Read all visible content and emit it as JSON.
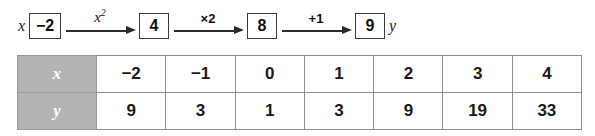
{
  "diagram": {
    "input_label": "x",
    "output_label": "y",
    "steps": [
      {
        "value": "−2",
        "op": "x²",
        "op_style": "serif-italic"
      },
      {
        "value": "4",
        "op": "×2",
        "op_style": "sans-bold"
      },
      {
        "value": "8",
        "op": "+1",
        "op_style": "sans-bold"
      },
      {
        "value": "9",
        "op": "",
        "op_style": ""
      }
    ],
    "op_superscripts": [
      "2",
      "",
      "",
      ""
    ],
    "op_bases": [
      "x",
      "×2",
      "+1",
      ""
    ]
  },
  "table": {
    "rows": [
      {
        "header": "x",
        "cells": [
          "−2",
          "−1",
          "0",
          "1",
          "2",
          "3",
          "4"
        ]
      },
      {
        "header": "y",
        "cells": [
          "9",
          "3",
          "1",
          "3",
          "9",
          "19",
          "33"
        ]
      }
    ]
  },
  "colors": {
    "header_fill": "#b4b4b4",
    "header_text": "#ffffff",
    "border": "#8e8e8e",
    "ink": "#1a1a1a",
    "background": "#ffffff"
  }
}
